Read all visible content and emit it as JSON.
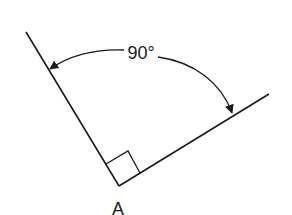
{
  "diagram": {
    "angle_label": "90°",
    "vertex_label": "A",
    "colors": {
      "stroke": "#1a1a1a",
      "background": "#ffffff"
    }
  }
}
